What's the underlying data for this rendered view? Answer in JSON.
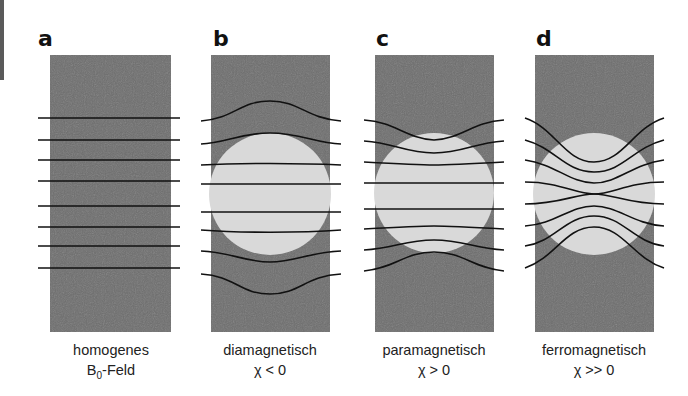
{
  "figure": {
    "colors": {
      "medium": "#6e6e6e",
      "object": "#d9d9d9",
      "field_line": "#111111",
      "edge_bar": "#5a5a5a"
    },
    "panels": [
      {
        "letter": "a",
        "label_line1": "homogenes",
        "label_line2_main": "B",
        "label_line2_sub": "0",
        "label_line2_rest": "-Feld",
        "has_object": false
      },
      {
        "letter": "b",
        "label_line1": "diamagnetisch",
        "label_line2": "χ < 0",
        "has_object": true
      },
      {
        "letter": "c",
        "label_line1": "paramagnetisch",
        "label_line2": "χ > 0",
        "has_object": true
      },
      {
        "letter": "d",
        "label_line1": "ferromagnetisch",
        "label_line2": "χ >> 0",
        "has_object": true
      }
    ]
  }
}
